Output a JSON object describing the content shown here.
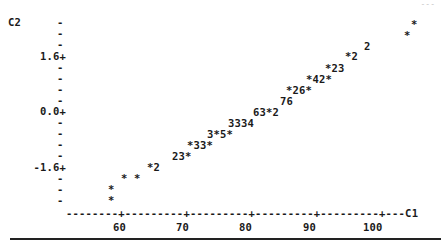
{
  "page_corner": "---",
  "ylabel": "C2",
  "xlabel": "C1",
  "yticks": [
    {
      "label": "1.6+",
      "y": 51
    },
    {
      "label": "0.0+",
      "y": 106
    },
    {
      "label": "-1.6+",
      "y": 162
    }
  ],
  "ydashes": [
    17,
    28,
    39,
    62,
    73,
    84,
    95,
    117,
    128,
    139,
    150,
    173,
    184,
    195
  ],
  "x_axis_line": "--------+---------+---------+---------+---------+---C1",
  "xticks": [
    {
      "label": "60",
      "x": 113
    },
    {
      "label": "70",
      "x": 176
    },
    {
      "label": "80",
      "x": 239
    },
    {
      "label": "90",
      "x": 303
    },
    {
      "label": "100",
      "x": 363
    }
  ],
  "plot_rows": [
    {
      "text": "*",
      "x": 411,
      "y": 19
    },
    {
      "text": "*",
      "x": 404,
      "y": 30
    },
    {
      "text": "2",
      "x": 364,
      "y": 41
    },
    {
      "text": "*2",
      "x": 345,
      "y": 51
    },
    {
      "text": "*23",
      "x": 325,
      "y": 63
    },
    {
      "text": "*42*",
      "x": 306,
      "y": 74
    },
    {
      "text": "*26*",
      "x": 286,
      "y": 85
    },
    {
      "text": "76",
      "x": 280,
      "y": 96
    },
    {
      "text": "63*2",
      "x": 253,
      "y": 107
    },
    {
      "text": "3334",
      "x": 228,
      "y": 118
    },
    {
      "text": "3*5*",
      "x": 207,
      "y": 129
    },
    {
      "text": "*33*",
      "x": 187,
      "y": 140
    },
    {
      "text": "23*",
      "x": 172,
      "y": 151
    },
    {
      "text": "*2",
      "x": 147,
      "y": 162
    },
    {
      "text": "*",
      "x": 121,
      "y": 173
    },
    {
      "text": "*",
      "x": 134,
      "y": 173
    },
    {
      "text": "*",
      "x": 108,
      "y": 184
    },
    {
      "text": "*",
      "x": 108,
      "y": 195
    }
  ],
  "chart_data": {
    "type": "scatter",
    "title": "",
    "xlabel": "C1",
    "ylabel": "C2",
    "xlim": [
      51,
      106
    ],
    "ylim": [
      -2.5,
      2.5
    ],
    "x_ticks": [
      60,
      70,
      80,
      90,
      100
    ],
    "y_ticks": [
      -1.6,
      0.0,
      1.6
    ],
    "grid": false,
    "legend": "none",
    "points_by_row": [
      {
        "y": 2.3,
        "marks": [
          {
            "x": 104.6,
            "count": 1
          }
        ]
      },
      {
        "y": 2.0,
        "marks": [
          {
            "x": 103.5,
            "count": 1
          }
        ]
      },
      {
        "y": 1.8,
        "marks": [
          {
            "x": 97.2,
            "count": 2
          }
        ]
      },
      {
        "y": 1.6,
        "marks": [
          {
            "x": 94.2,
            "count": 1
          },
          {
            "x": 95.8,
            "count": 2
          }
        ]
      },
      {
        "y": 1.3,
        "marks": [
          {
            "x": 91.0,
            "count": 1
          },
          {
            "x": 92.6,
            "count": 2
          },
          {
            "x": 94.2,
            "count": 3
          }
        ]
      },
      {
        "y": 1.0,
        "marks": [
          {
            "x": 88.0,
            "count": 1
          },
          {
            "x": 89.6,
            "count": 4
          },
          {
            "x": 91.1,
            "count": 2
          },
          {
            "x": 92.7,
            "count": 1
          }
        ]
      },
      {
        "y": 0.7,
        "marks": [
          {
            "x": 84.9,
            "count": 1
          },
          {
            "x": 86.5,
            "count": 2
          },
          {
            "x": 88.0,
            "count": 6
          },
          {
            "x": 89.6,
            "count": 1
          }
        ]
      },
      {
        "y": 0.4,
        "marks": [
          {
            "x": 84.0,
            "count": 7
          },
          {
            "x": 85.6,
            "count": 6
          }
        ]
      },
      {
        "y": 0.1,
        "marks": [
          {
            "x": 79.7,
            "count": 6
          },
          {
            "x": 81.3,
            "count": 3
          },
          {
            "x": 82.9,
            "count": 1
          },
          {
            "x": 84.4,
            "count": 2
          }
        ]
      },
      {
        "y": -0.2,
        "marks": [
          {
            "x": 75.8,
            "count": 3
          },
          {
            "x": 77.4,
            "count": 3
          },
          {
            "x": 78.9,
            "count": 3
          },
          {
            "x": 80.5,
            "count": 4
          }
        ]
      },
      {
        "y": -0.5,
        "marks": [
          {
            "x": 72.5,
            "count": 3
          },
          {
            "x": 74.1,
            "count": 1
          },
          {
            "x": 75.6,
            "count": 5
          },
          {
            "x": 77.2,
            "count": 1
          }
        ]
      },
      {
        "y": -0.8,
        "marks": [
          {
            "x": 69.3,
            "count": 1
          },
          {
            "x": 70.9,
            "count": 3
          },
          {
            "x": 72.5,
            "count": 3
          },
          {
            "x": 74.0,
            "count": 1
          }
        ]
      },
      {
        "y": -1.1,
        "marks": [
          {
            "x": 66.9,
            "count": 2
          },
          {
            "x": 68.5,
            "count": 3
          },
          {
            "x": 70.1,
            "count": 1
          }
        ]
      },
      {
        "y": -1.6,
        "marks": [
          {
            "x": 63.0,
            "count": 1
          },
          {
            "x": 64.6,
            "count": 2
          }
        ]
      },
      {
        "y": -1.9,
        "marks": [
          {
            "x": 59.0,
            "count": 1
          },
          {
            "x": 61.0,
            "count": 1
          }
        ]
      },
      {
        "y": -2.2,
        "marks": [
          {
            "x": 57.0,
            "count": 1
          }
        ]
      },
      {
        "y": -2.5,
        "marks": [
          {
            "x": 57.0,
            "count": 1
          }
        ]
      }
    ]
  }
}
